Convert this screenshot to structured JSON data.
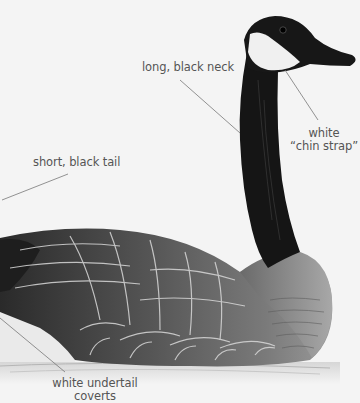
{
  "illustration": {
    "subject": "Canada goose swimming, side view",
    "colors": {
      "background": "#f4f4f4",
      "neck_black": "#141414",
      "chin_strap_white": "#f2f2f2",
      "body_grey": "#5a5a5a",
      "breast_grey": "#8a8a8a",
      "label_text": "#555555",
      "leader_line": "#777777"
    }
  },
  "labels": {
    "neck": "long, black neck",
    "chin_line1": "white",
    "chin_line2": "“chin strap”",
    "tail": "short, black tail",
    "coverts_line1": "white undertail",
    "coverts_line2": "coverts"
  }
}
